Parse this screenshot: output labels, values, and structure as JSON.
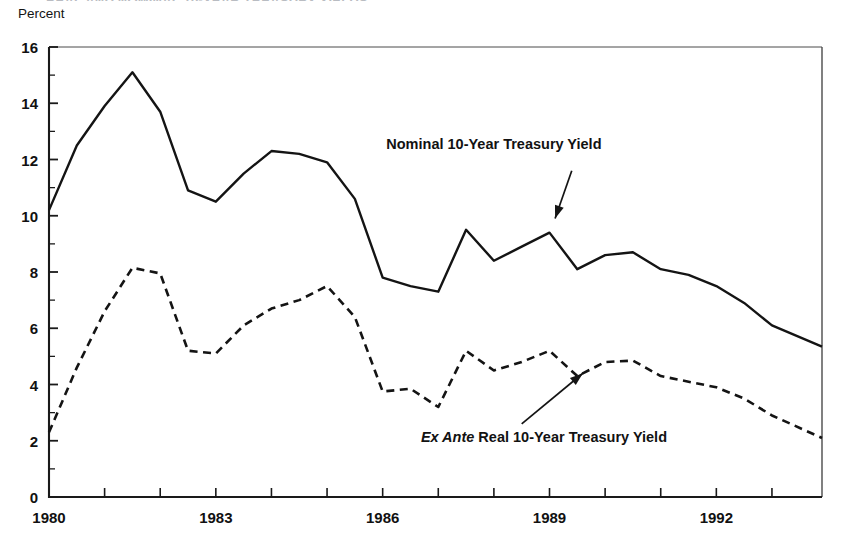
{
  "figure": {
    "cut_title": "REAL AND NOMINAL 10-YEAR TREASURY YIELDS",
    "y_axis_unit": "Percent"
  },
  "chart_data": {
    "type": "line",
    "title": "",
    "subtitle": "",
    "xlabel": "",
    "ylabel": "Percent",
    "xlim": [
      1980,
      1993.9
    ],
    "ylim": [
      0,
      16
    ],
    "y_ticks": [
      0,
      2,
      4,
      6,
      8,
      10,
      12,
      14,
      16
    ],
    "y_tick_labels": [
      "0",
      "2",
      "4",
      "6",
      "8",
      "10",
      "12",
      "14",
      "16"
    ],
    "y_minor_tick_interval": 1,
    "x_ticks": [
      1980,
      1981,
      1982,
      1983,
      1984,
      1985,
      1986,
      1987,
      1988,
      1989,
      1990,
      1991,
      1992,
      1993
    ],
    "x_tick_labels_shown": [
      "1980",
      "1983",
      "1986",
      "1989",
      "1992"
    ],
    "x_tick_labels_values": [
      1980,
      1983,
      1986,
      1989,
      1992
    ],
    "grid": false,
    "legend_position": "inline-annotations",
    "series": [
      {
        "name": "Nominal 10-Year Treasury Yield",
        "style": "solid",
        "color": "#141414",
        "x": [
          1980.0,
          1980.5,
          1981.0,
          1981.5,
          1982.0,
          1982.5,
          1983.0,
          1983.5,
          1984.0,
          1984.5,
          1985.0,
          1985.5,
          1986.0,
          1986.5,
          1987.0,
          1987.5,
          1988.0,
          1988.5,
          1989.0,
          1989.5,
          1990.0,
          1990.5,
          1991.0,
          1991.5,
          1992.0,
          1992.5,
          1993.0,
          1993.9
        ],
        "values": [
          10.2,
          12.5,
          13.9,
          15.1,
          13.7,
          10.9,
          10.5,
          11.5,
          12.3,
          12.2,
          11.9,
          10.6,
          7.8,
          7.5,
          7.3,
          9.5,
          8.4,
          8.9,
          9.4,
          8.1,
          8.6,
          8.7,
          8.1,
          7.9,
          7.5,
          6.9,
          6.1,
          5.35
        ]
      },
      {
        "name": "Ex Ante Real 10-Year Treasury Yield",
        "style": "dashed",
        "color": "#141414",
        "x": [
          1980.0,
          1980.5,
          1981.0,
          1981.5,
          1982.0,
          1982.5,
          1983.0,
          1983.5,
          1984.0,
          1984.5,
          1985.0,
          1985.5,
          1986.0,
          1986.5,
          1987.0,
          1987.5,
          1988.0,
          1988.5,
          1989.0,
          1989.5,
          1990.0,
          1990.5,
          1991.0,
          1991.5,
          1992.0,
          1992.5,
          1993.0,
          1993.9
        ],
        "values": [
          2.3,
          4.6,
          6.6,
          8.15,
          7.95,
          5.2,
          5.1,
          6.1,
          6.7,
          7.0,
          7.5,
          6.4,
          3.75,
          3.85,
          3.2,
          5.2,
          4.5,
          4.8,
          5.2,
          4.3,
          4.8,
          4.85,
          4.3,
          4.1,
          3.9,
          3.5,
          2.9,
          2.1
        ]
      }
    ],
    "annotations": [
      {
        "name": "nominal-series-label",
        "text_plain": "Nominal 10-Year Treasury Yield",
        "text_prefix_italic": "",
        "text_rest": "Nominal 10-Year Treasury Yield",
        "label_x": 1988.0,
        "label_y": 12.5,
        "arrow_from": [
          1989.4,
          11.6
        ],
        "arrow_to": [
          1989.1,
          9.9
        ]
      },
      {
        "name": "real-series-label",
        "text_plain": "Ex Ante Real 10-Year Treasury Yield",
        "text_prefix_italic": "Ex Ante",
        "text_rest": " Real 10-Year Treasury Yield",
        "label_x": 1988.9,
        "label_y": 2.1,
        "arrow_from": [
          1988.5,
          2.6
        ],
        "arrow_to": [
          1989.6,
          4.4
        ]
      }
    ]
  }
}
